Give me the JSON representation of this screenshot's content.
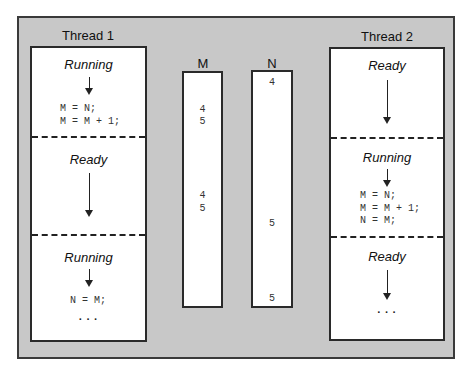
{
  "thread1": {
    "title": "Thread 1",
    "sections": [
      {
        "state": "Running",
        "code": "M = N;\nM = M + 1;"
      },
      {
        "state": "Ready"
      },
      {
        "state": "Running",
        "code": "N = M;",
        "ellipsis": "..."
      }
    ]
  },
  "variables": {
    "M": {
      "title": "M",
      "values": [
        "4",
        "5",
        "4",
        "5"
      ]
    },
    "N": {
      "title": "N",
      "values": [
        "4",
        "5",
        "5"
      ]
    }
  },
  "thread2": {
    "title": "Thread 2",
    "sections": [
      {
        "state": "Ready"
      },
      {
        "state": "Running",
        "code": "M = N;\nM = M + 1;\nN = M;"
      },
      {
        "state": "Ready",
        "ellipsis": "..."
      }
    ]
  },
  "colors": {
    "background": "#c8c8c8",
    "box": "#ffffff",
    "border": "#2a2a2a"
  }
}
